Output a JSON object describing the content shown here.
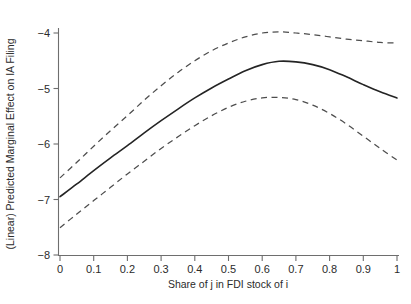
{
  "chart_data": {
    "type": "line",
    "title": "",
    "subtitle": "",
    "xlabel": "Share of j in FDI stock of i",
    "ylabel": "(Linear) Predicted Marginal Effect on IA Filing",
    "xlim": [
      0,
      1
    ],
    "ylim": [
      -8,
      -4
    ],
    "grid": false,
    "legend": "none",
    "x_tick_labels": [
      "0",
      "0.1",
      "0.2",
      "0.3",
      "0.4",
      "0.5",
      "0.6",
      "0.7",
      "0.8",
      "0.9",
      "1"
    ],
    "x_tick_values": [
      0,
      0.1,
      0.2,
      0.3,
      0.4,
      0.5,
      0.6,
      0.7,
      0.8,
      0.9,
      1
    ],
    "y_tick_labels": [
      "-4",
      "-5",
      "-6",
      "-7",
      "-8"
    ],
    "y_tick_values": [
      -4,
      -5,
      -6,
      -7,
      -8
    ],
    "x": [
      0,
      0.05,
      0.1,
      0.15,
      0.2,
      0.25,
      0.3,
      0.35,
      0.4,
      0.45,
      0.5,
      0.55,
      0.6,
      0.65,
      0.7,
      0.75,
      0.8,
      0.85,
      0.9,
      0.95,
      1
    ],
    "series": [
      {
        "name": "Predicted marginal effect",
        "style": "solid",
        "color": "#242424",
        "values": [
          -6.95,
          -6.72,
          -6.48,
          -6.25,
          -6.03,
          -5.8,
          -5.58,
          -5.37,
          -5.17,
          -4.99,
          -4.83,
          -4.68,
          -4.57,
          -4.51,
          -4.52,
          -4.57,
          -4.66,
          -4.79,
          -4.93,
          -5.06,
          -5.17
        ]
      },
      {
        "name": "Upper 95% confidence bound",
        "style": "dashed",
        "color": "#4d4d4d",
        "values": [
          -6.61,
          -6.33,
          -6.04,
          -5.76,
          -5.49,
          -5.21,
          -4.95,
          -4.71,
          -4.5,
          -4.32,
          -4.18,
          -4.07,
          -4.0,
          -3.98,
          -4.0,
          -4.03,
          -4.07,
          -4.11,
          -4.14,
          -4.17,
          -4.18
        ]
      },
      {
        "name": "Lower 95% confidence bound",
        "style": "dashed",
        "color": "#4d4d4d",
        "values": [
          -7.51,
          -7.26,
          -7.02,
          -6.78,
          -6.54,
          -6.31,
          -6.08,
          -5.87,
          -5.67,
          -5.49,
          -5.34,
          -5.23,
          -5.17,
          -5.16,
          -5.2,
          -5.3,
          -5.45,
          -5.64,
          -5.86,
          -6.08,
          -6.29
        ]
      }
    ],
    "annotations": []
  }
}
